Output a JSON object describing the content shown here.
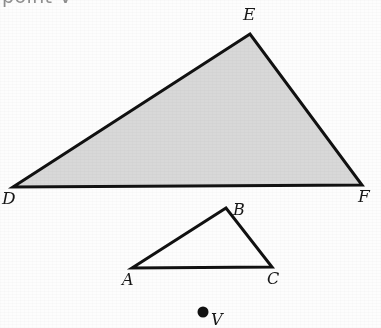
{
  "figure": {
    "background_color": "#fdfdfd",
    "stroke_color": "#111111",
    "fill_color": "#d8d8d8",
    "caption_clipped": "point V",
    "shapes": {
      "large_triangle": {
        "name": "DEF",
        "filled": true,
        "fill_color": "#d8d8d8",
        "stroke_color": "#111111",
        "stroke_width": 3,
        "points": "13,187 250,34 362,185",
        "vertices": [
          {
            "label": "D",
            "x": 13,
            "y": 187,
            "label_x": 2,
            "label_y": 190
          },
          {
            "label": "E",
            "x": 250,
            "y": 34,
            "label_x": 243,
            "label_y": 6
          },
          {
            "label": "F",
            "x": 362,
            "y": 185,
            "label_x": 358,
            "label_y": 188
          }
        ]
      },
      "small_triangle": {
        "name": "ABC",
        "filled": false,
        "fill_color": "none",
        "stroke_color": "#111111",
        "stroke_width": 3,
        "points": "132,268 226,208 272,267",
        "vertices": [
          {
            "label": "A",
            "x": 132,
            "y": 268,
            "label_x": 122,
            "label_y": 272
          },
          {
            "label": "B",
            "x": 226,
            "y": 208,
            "label_x": 233,
            "label_y": 202
          },
          {
            "label": "C",
            "x": 272,
            "y": 267,
            "label_x": 267,
            "label_y": 271
          }
        ]
      },
      "point_v": {
        "label": "V",
        "x": 203,
        "y": 312,
        "radius": 5.5,
        "fill_color": "#111111",
        "label_x": 211,
        "label_y": 312
      }
    }
  }
}
